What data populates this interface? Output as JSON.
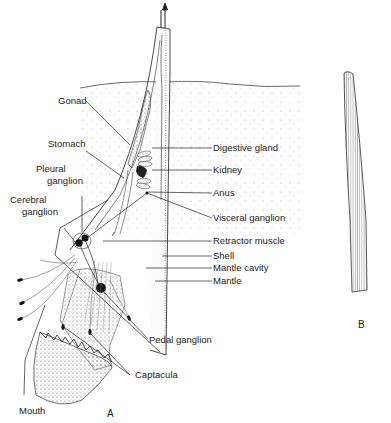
{
  "figure": {
    "panels": [
      {
        "id": "A",
        "label": "A"
      },
      {
        "id": "B",
        "label": "B"
      }
    ],
    "labels_left": [
      {
        "key": "gonad",
        "text": "Gonad"
      },
      {
        "key": "stomach",
        "text": "Stomach"
      },
      {
        "key": "pleural_ganglion_1",
        "text": "Pleural"
      },
      {
        "key": "pleural_ganglion_2",
        "text": "ganglion"
      },
      {
        "key": "cerebral_ganglion_1",
        "text": "Cerebral"
      },
      {
        "key": "cerebral_ganglion_2",
        "text": "ganglion"
      },
      {
        "key": "mouth",
        "text": "Mouth"
      }
    ],
    "labels_right": [
      {
        "key": "digestive_gland",
        "text": "Digestive gland"
      },
      {
        "key": "kidney",
        "text": "Kidney"
      },
      {
        "key": "anus",
        "text": "Anus"
      },
      {
        "key": "visceral_ganglion",
        "text": "Visceral ganglion"
      },
      {
        "key": "retractor_muscle",
        "text": "Retractor muscle"
      },
      {
        "key": "shell",
        "text": "Shell"
      },
      {
        "key": "mantle_cavity",
        "text": "Mantle cavity"
      },
      {
        "key": "mantle",
        "text": "Mantle"
      },
      {
        "key": "pedal_ganglion",
        "text": "Pedal ganglion"
      },
      {
        "key": "captacula",
        "text": "Captacula"
      }
    ],
    "colors": {
      "ink": "#222222",
      "background": "#ffffff",
      "sediment_dot": "#9a9a9a"
    }
  }
}
